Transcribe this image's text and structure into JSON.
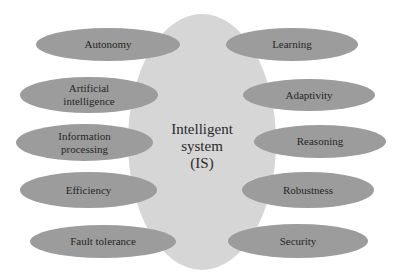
{
  "center": {
    "lines": [
      "Intelligent",
      "system",
      "(IS)"
    ],
    "fill": "#d6d6d6"
  },
  "node_fill": "#9c9c9c",
  "left_nodes": [
    {
      "lines": [
        "Autonomy"
      ]
    },
    {
      "lines": [
        "Artificial",
        "intelligence"
      ]
    },
    {
      "lines": [
        "Information",
        "processing"
      ]
    },
    {
      "lines": [
        "Efficiency"
      ]
    },
    {
      "lines": [
        "Fault tolerance"
      ]
    }
  ],
  "right_nodes": [
    {
      "lines": [
        "Learning"
      ]
    },
    {
      "lines": [
        "Adaptivity"
      ]
    },
    {
      "lines": [
        "Reasoning"
      ]
    },
    {
      "lines": [
        "Robustness"
      ]
    },
    {
      "lines": [
        "Security"
      ]
    }
  ]
}
